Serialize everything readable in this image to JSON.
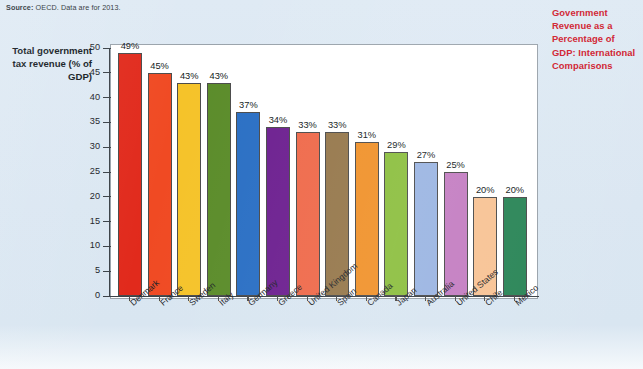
{
  "source_note": {
    "label": "Source:",
    "text": " OECD. Data are for 2013."
  },
  "title": "Government Revenue as a Percentage of GDP: International Comparisons",
  "title_color": "#d0202e",
  "y_axis_title": "Total government tax revenue (% of GDP)",
  "chart_data": {
    "type": "bar",
    "title": "Government Revenue as a Percentage of GDP: International Comparisons",
    "xlabel": "",
    "ylabel": "Total government tax revenue (% of GDP)",
    "ylim": [
      0,
      50
    ],
    "yticks": [
      0,
      5,
      10,
      15,
      20,
      25,
      30,
      35,
      40,
      45,
      50
    ],
    "grid": false,
    "legend": "none",
    "source": "Source: OECD. Data are for 2013.",
    "categories": [
      "Denmark",
      "France",
      "Sweden",
      "Italy",
      "Germany",
      "Greece",
      "United Kingdom",
      "Spain",
      "Canada",
      "Japan",
      "Australia",
      "United States",
      "Chile",
      "Mexico"
    ],
    "values": [
      49,
      45,
      43,
      43,
      37,
      34,
      33,
      33,
      31,
      29,
      27,
      25,
      20,
      20
    ],
    "value_labels": [
      "49%",
      "45%",
      "43%",
      "43%",
      "37%",
      "34%",
      "33%",
      "33%",
      "31%",
      "29%",
      "27%",
      "25%",
      "20%",
      "20%"
    ],
    "colors": [
      "#e12a1c",
      "#f04a23",
      "#f5c32a",
      "#5b8c2a",
      "#2a6fc4",
      "#6d2090",
      "#ef6a4b",
      "#96784c",
      "#f0922b",
      "#8cbf3f",
      "#9bb5e2",
      "#c47ec2",
      "#f8c395",
      "#2a8557"
    ]
  }
}
